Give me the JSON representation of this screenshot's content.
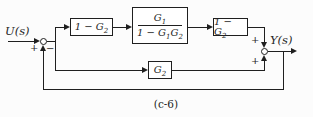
{
  "figure": {
    "caption": "(c-6)",
    "colors": {
      "line": "#1f1f1f",
      "background": "#fcfcfc",
      "block_fill": "#ffffff"
    }
  },
  "labels": {
    "input": "U(s)",
    "output": "Y(s)"
  },
  "signs": {
    "sum1_plus": "+",
    "sum1_minus": "−",
    "sum2_plus_top": "+",
    "sum2_plus_bottom": "+"
  },
  "blocks": {
    "b1": {
      "base": "1 − G",
      "sub": "2"
    },
    "b2": {
      "num_base": "G",
      "num_sub": "1",
      "den_base": "1 − G",
      "den_sub1": "1",
      "den_mid": "G",
      "den_sub2": "2"
    },
    "b3": {
      "base": "1 − G",
      "sub": "2"
    },
    "b4": {
      "base": "G",
      "sub": "2"
    }
  }
}
